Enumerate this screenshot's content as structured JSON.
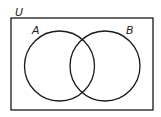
{
  "diagram": {
    "type": "venn",
    "universe_label": "U",
    "sets": [
      {
        "label": "A"
      },
      {
        "label": "B"
      }
    ],
    "stroke_color": "#1a1a1a",
    "background": "#ffffff"
  }
}
